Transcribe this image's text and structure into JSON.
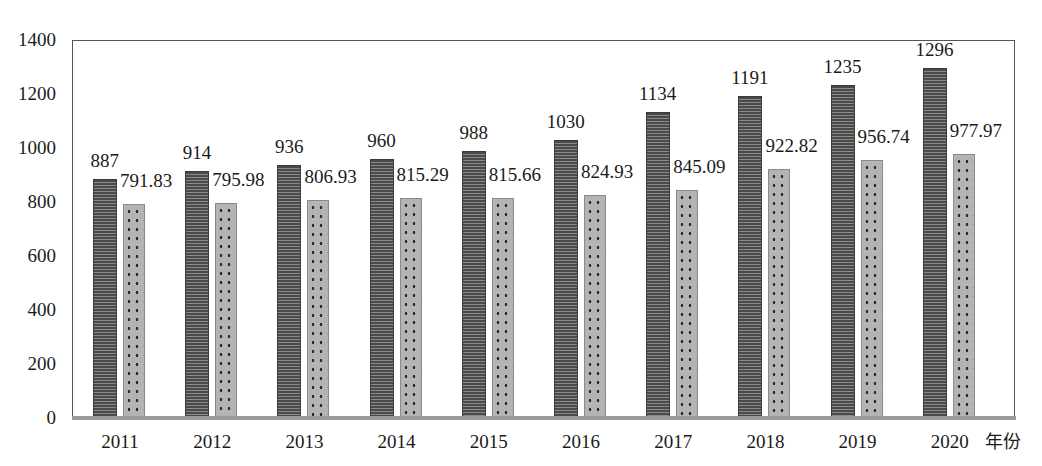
{
  "chart_data": {
    "type": "bar",
    "title": "",
    "xlabel": "年份",
    "ylabel": "",
    "ylim": [
      0,
      1400
    ],
    "yticks": [
      0,
      200,
      400,
      600,
      800,
      1000,
      1200,
      1400
    ],
    "grid": false,
    "legend": null,
    "categories": [
      "2011",
      "2012",
      "2013",
      "2014",
      "2015",
      "2016",
      "2017",
      "2018",
      "2019",
      "2020"
    ],
    "series": [
      {
        "name": "series-1 (dark striped)",
        "pattern": "horizontal-stripes",
        "color": "#4a4a4a",
        "values": [
          887,
          914,
          936,
          960,
          988,
          1030,
          1134,
          1191,
          1235,
          1296
        ],
        "labels": [
          "887",
          "914",
          "936",
          "960",
          "988",
          "1030",
          "1134",
          "1191",
          "1235",
          "1296"
        ]
      },
      {
        "name": "series-2 (light dotted)",
        "pattern": "dots",
        "color": "#b4b4b4",
        "values": [
          791.83,
          795.98,
          806.93,
          815.29,
          815.66,
          824.93,
          845.09,
          922.82,
          956.74,
          977.97
        ],
        "labels": [
          "791.83",
          "795.98",
          "806.93",
          "815.29",
          "815.66",
          "824.93",
          "845.09",
          "922.82",
          "956.74",
          "977.97"
        ]
      }
    ]
  },
  "axis": {
    "y_tick_labels": [
      "1400",
      "1200",
      "1000",
      "800",
      "600",
      "400",
      "200",
      "0"
    ],
    "x_unit_label": "年份"
  }
}
